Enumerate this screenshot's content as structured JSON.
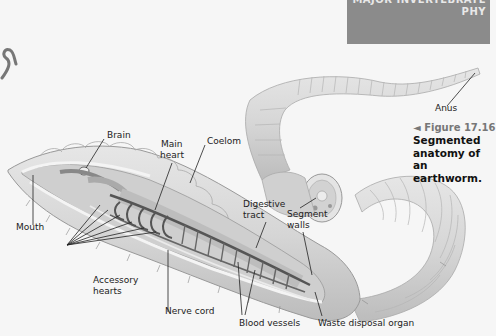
{
  "header": {
    "line1": "MAJOR INVERTEBRATE",
    "line2": "PHY",
    "box_color": "#8b8b8b"
  },
  "figure": {
    "number": "◄ Figure 17.16",
    "title": "Segmented anatomy of an earthworm.",
    "title_lines": [
      "Segmented",
      "anatomy of an",
      "earthworm."
    ]
  },
  "labels": {
    "brain": "Brain",
    "main_heart_1": "Main",
    "main_heart_2": "heart",
    "coelom": "Coelom",
    "digestive_1": "Digestive",
    "digestive_2": "tract",
    "segment_1": "Segment",
    "segment_2": "walls",
    "mouth": "Mouth",
    "accessory_1": "Accessory",
    "accessory_2": "hearts",
    "nerve_cord": "Nerve cord",
    "blood_vessels": "Blood vessels",
    "waste": "Waste disposal organ",
    "anus": "Anus"
  },
  "colors": {
    "worm_fill": "#d9d9d9",
    "worm_shade": "#bdbdbd",
    "vessel": "#555555",
    "inner": "#c8c8c8"
  }
}
